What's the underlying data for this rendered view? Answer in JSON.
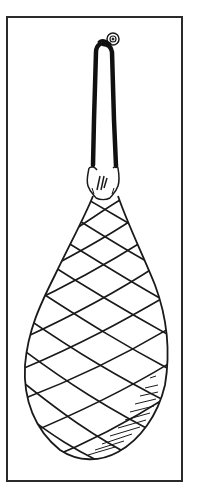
{
  "illustration": {
    "subject": "cured ham hanging in a string net from a hook",
    "caption": "",
    "line_color": "#1a1a1a",
    "background": "#ffffff",
    "frame_color": "#2a2a2a"
  }
}
